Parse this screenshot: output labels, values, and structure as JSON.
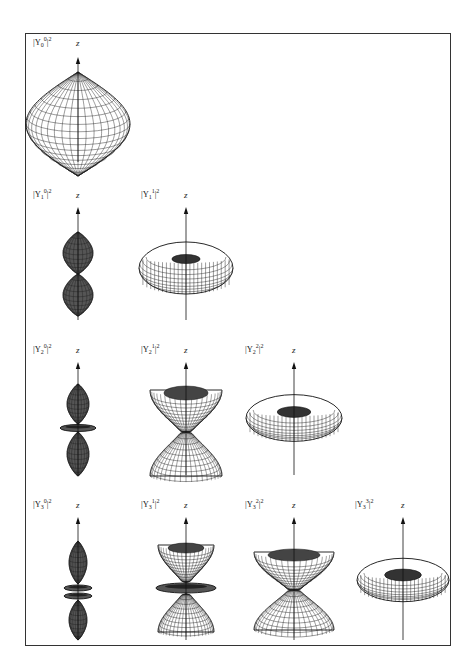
{
  "axis_label": "z",
  "rows": [
    {
      "l": 0,
      "panels": [
        {
          "label": "|Y",
          "sub": "0",
          "sup": "0",
          "tail": "|2",
          "shape": "sphere"
        }
      ]
    },
    {
      "l": 1,
      "panels": [
        {
          "label": "|Y",
          "sub": "1",
          "sup": "0",
          "tail": "|2",
          "shape": "two-lobes"
        },
        {
          "label": "|Y",
          "sub": "1",
          "sup": "1",
          "tail": "|2",
          "shape": "torus"
        }
      ]
    },
    {
      "l": 2,
      "panels": [
        {
          "label": "|Y",
          "sub": "2",
          "sup": "0",
          "tail": "|2",
          "shape": "lobes-ring"
        },
        {
          "label": "|Y",
          "sub": "2",
          "sup": "1",
          "tail": "|2",
          "shape": "double-cone"
        },
        {
          "label": "|Y",
          "sub": "2",
          "sup": "2",
          "tail": "|2",
          "shape": "flat-torus"
        }
      ]
    },
    {
      "l": 3,
      "panels": [
        {
          "label": "|Y",
          "sub": "3",
          "sup": "0",
          "tail": "|2",
          "shape": "lobes-two-rings"
        },
        {
          "label": "|Y",
          "sub": "3",
          "sup": "1",
          "tail": "|2",
          "shape": "cones-ring"
        },
        {
          "label": "|Y",
          "sub": "3",
          "sup": "2",
          "tail": "|2",
          "shape": "double-cone-wide"
        },
        {
          "label": "|Y",
          "sub": "3",
          "sup": "3",
          "tail": "|2",
          "shape": "flat-torus-thin"
        }
      ]
    }
  ]
}
